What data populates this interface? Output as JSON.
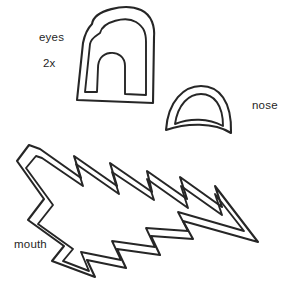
{
  "page": {
    "background_color": "#ffffff",
    "ink_color": "#262626",
    "text_color": "#1f1f1f",
    "width": 301,
    "height": 292
  },
  "labels": {
    "eyes": "eyes",
    "quantity": "2x",
    "nose": "nose",
    "mouth": "mouth"
  },
  "shapes": [
    {
      "name": "eye-template",
      "label": "eyes",
      "quantity": "2x",
      "description": "arch / horseshoe outline with inner arch notch, double contour",
      "outer_path": "M 92 24 C 94 10, 125 3, 141 10 C 152 15, 155 27, 154 38 L 153 103 L 77 100 L 83 43 C 85 33, 88 28, 92 24 Z",
      "inner_path": "M 100 33 C 103 21, 126 16, 136 22 C 144 27, 146 33, 146 42 L 146 95 L 125 94 L 125 66 C 125 57, 118 52, 110 53 C 102 54, 98 60, 98 68 L 97 92 L 85 92 L 90 44 C 91 38, 96 36, 100 33 Z"
    },
    {
      "name": "nose-template",
      "label": "nose",
      "description": "dome / cap outline with concave bottom edge, double contour",
      "outer_path": "M 166 130 C 168 101, 184 86, 201 86 C 219 86, 232 101, 231 133 C 214 122, 186 123, 166 130 Z",
      "inner_path": "M 175 124 C 178 104, 189 94, 201 94 C 214 94, 223 105, 223 126 C 208 118, 190 118, 175 124 Z"
    },
    {
      "name": "mouth-template",
      "label": "mouth",
      "description": "zigzag lightning band, double contour, tapering to a point at right",
      "outer_path": "M 29 145 L 17 161 L 44 199 L 28 220 L 64 246 L 52 261 L 95 277 L 87 260 L 126 268 L 117 249 L 160 255 L 151 236 L 193 239 L 183 221 L 258 242 L 215 186 L 222 207 L 180 177 L 187 199 L 147 171 L 152 192 L 110 163 L 117 186 L 74 156 L 81 178 L 40 149 Z",
      "inner_path": "M 36 156 L 26 168 L 53 205 L 38 224 L 73 249 L 63 261 L 89 271 L 81 252 L 121 260 L 112 241 L 155 247 L 146 228 L 188 231 L 178 212 L 244 231 L 215 194 L 222 215 L 181 186 L 188 208 L 147 179 L 154 200 L 112 172 L 119 194 L 76 164 L 83 186 L 42 158 Z"
    }
  ]
}
